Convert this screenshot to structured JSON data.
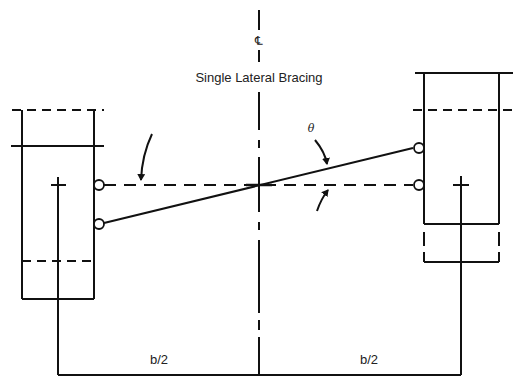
{
  "diagram": {
    "title": "Single Lateral Bracing",
    "centerline_symbol": "℄",
    "angle_label": "θ",
    "dimensions": {
      "left_half": "b/2",
      "right_half": "b/2"
    },
    "colors": {
      "line": "#111111",
      "background": "#ffffff"
    },
    "elements": [
      {
        "name": "left-column",
        "type": "box",
        "note": "lower position, with solid and dashed lines"
      },
      {
        "name": "right-column",
        "type": "box",
        "note": "upper position, with solid and dashed lines"
      },
      {
        "name": "centerline",
        "type": "dash-dot-vertical"
      },
      {
        "name": "lateral-brace",
        "type": "inclined-line",
        "from": "left-column lower pin",
        "to": "right-column upper pin"
      },
      {
        "name": "reference-line",
        "type": "dashed-horizontal",
        "between": "left pin and right pin"
      },
      {
        "name": "dimension-line",
        "type": "bracket",
        "labels": [
          "b/2",
          "b/2"
        ]
      }
    ]
  }
}
